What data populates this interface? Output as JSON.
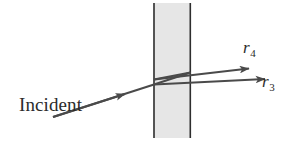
{
  "figure": {
    "background_color": "#ffffff",
    "ray_color": "#4a4a4a",
    "slab_fill_color": "#e6e6e6",
    "slab_edge_color": "#2e2e2e",
    "text_color": "#2b2b2b"
  },
  "labels": {
    "incident": "Incident\nlight",
    "incident_line1": "Incident",
    "incident_line2": "light",
    "ray4_symbol": "r",
    "ray4_subscript": "4",
    "ray3_symbol": "r",
    "ray3_subscript": "3"
  },
  "slab": {
    "left": 153,
    "right": 191,
    "top": 3,
    "bottom": 138
  },
  "rays": [
    {
      "name": "incident-ray",
      "label": "Incident light",
      "from": [
        53,
        117
      ],
      "to": [
        153,
        84
      ],
      "arrowhead_at": [
        120,
        95
      ]
    },
    {
      "name": "internal-ray-down",
      "label": "",
      "from": [
        153,
        84
      ],
      "to": [
        191,
        72
      ]
    },
    {
      "name": "internal-ray-reflect",
      "label": "",
      "from": [
        191,
        72
      ],
      "to": [
        153,
        80
      ]
    },
    {
      "name": "exit-ray-r4",
      "label": "r4",
      "from": [
        153,
        80
      ],
      "to": [
        250,
        70
      ]
    },
    {
      "name": "exit-ray-r3",
      "label": "r3",
      "from": [
        153,
        84
      ],
      "to": [
        266,
        80
      ]
    }
  ]
}
